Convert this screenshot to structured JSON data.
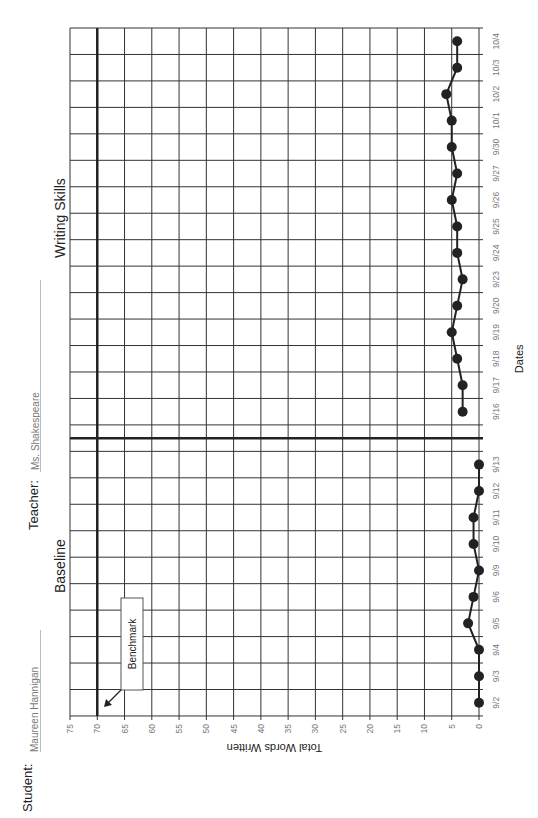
{
  "header": {
    "student_label": "Student:",
    "student_name": "Maureen Hannigan",
    "teacher_label": "Teacher:",
    "teacher_name": "Ms. Shakespeare"
  },
  "phases": {
    "baseline_label": "Baseline",
    "intervention_label": "Writing Skills"
  },
  "annotation": {
    "benchmark_label": "Benchmark",
    "benchmark_value": 70
  },
  "colors": {
    "grid": "#333333",
    "heavy_line": "#222222",
    "point": "#222222",
    "text": "#222222",
    "muted_text": "#777777"
  },
  "chart_data": {
    "type": "line",
    "title": "",
    "orientation": "rotated 90deg counter-clockwise (value axis runs horizontally, dates vertically)",
    "xlabel": "Dates",
    "ylabel": "Total Words Written",
    "ylim": [
      0,
      75
    ],
    "y_ticks": [
      0,
      5,
      10,
      15,
      20,
      25,
      30,
      35,
      40,
      45,
      50,
      55,
      60,
      65,
      70,
      75
    ],
    "grid": true,
    "legend": null,
    "benchmark": 70,
    "phase_change_between": [
      "9/13",
      "9/16"
    ],
    "series": [
      {
        "name": "Baseline",
        "x": [
          "9/2",
          "9/3",
          "9/4",
          "9/5",
          "9/6",
          "9/9",
          "9/10",
          "9/11",
          "9/12",
          "9/13"
        ],
        "values": [
          0,
          0,
          0,
          2,
          1,
          0,
          1,
          1,
          0,
          0
        ]
      },
      {
        "name": "Writing Skills",
        "x": [
          "9/16",
          "9/17",
          "9/18",
          "9/19",
          "9/20",
          "9/23",
          "9/24",
          "9/25",
          "9/26",
          "9/27",
          "9/30",
          "10/1",
          "10/2",
          "10/3",
          "10/4"
        ],
        "values": [
          3,
          3,
          4,
          5,
          4,
          3,
          4,
          4,
          5,
          4,
          5,
          5,
          6,
          4,
          4
        ]
      }
    ]
  }
}
